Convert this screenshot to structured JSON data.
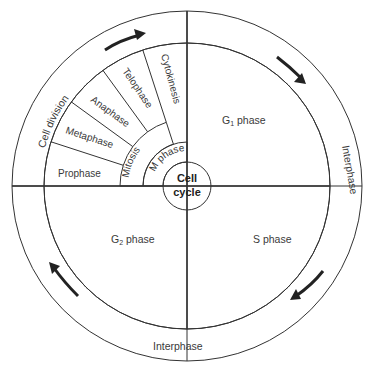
{
  "title": "Cell cycle",
  "center": {
    "line1": "Cell",
    "line2": "cycle"
  },
  "outer_ring": {
    "cell_division_label": "Cell division",
    "interphase_right_label": "Interphase",
    "interphase_bottom_label": "Interphase",
    "arrows": [
      "clockwise-arrow-top",
      "clockwise-arrow-right",
      "clockwise-arrow-bottom-right",
      "clockwise-arrow-bottom-left"
    ]
  },
  "quadrants": {
    "g1": {
      "label": "G",
      "sub": "1",
      "suffix": " phase"
    },
    "s": {
      "label": "S phase"
    },
    "g2": {
      "label": "G",
      "sub": "2",
      "suffix": " phase"
    }
  },
  "m_phase": {
    "label": "M phase",
    "mitosis_label": "Mitosis",
    "stages": [
      "Prophase",
      "Metaphase",
      "Anaphase",
      "Telophase",
      "Cytokinesis"
    ]
  },
  "colors": {
    "g1": "#e9e9e9",
    "s": "#c9c9c9",
    "g2": "#a9a9a9",
    "division_band": "#e6e6e6",
    "interphase_band": "#ffffff",
    "stage_fill": "#f0f0f0",
    "mitosis": "#7a7a7a",
    "m_phase": "#9a9a9a",
    "center": "#a0a0a0"
  }
}
